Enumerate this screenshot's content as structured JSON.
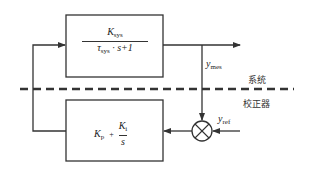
{
  "diagram": {
    "type": "control-loop block diagram",
    "colors": {
      "line": "#333333",
      "background": "#ffffff"
    },
    "plant_block": {
      "numerator": {
        "symbol": "K",
        "subscript": "sys"
      },
      "denominator": {
        "symbol": "τ",
        "subscript": "sys",
        "rest": " · s+1"
      }
    },
    "controller_block": {
      "term1": {
        "symbol": "K",
        "subscript": "p"
      },
      "operator": "+",
      "fraction": {
        "numerator_symbol": "K",
        "numerator_subscript": "i",
        "denominator": "s"
      }
    },
    "signals": {
      "measured": {
        "symbol": "y",
        "subscript": "mes"
      },
      "reference": {
        "symbol": "y",
        "subscript": "ref"
      }
    },
    "regions": {
      "system_label": "系统",
      "controller_label": "校正器"
    }
  }
}
